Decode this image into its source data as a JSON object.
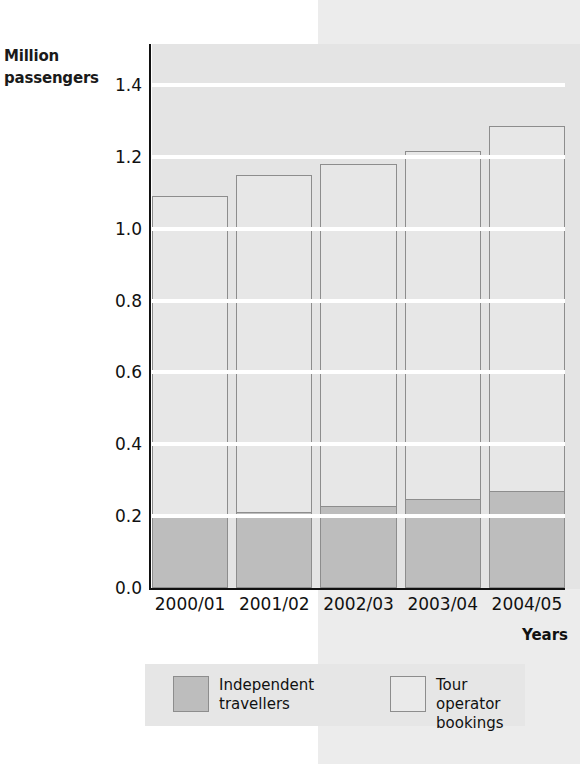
{
  "chart_data": {
    "type": "bar",
    "stacked": true,
    "title": "",
    "subtitle": "",
    "xlabel": "Years",
    "ylabel": "Million passengers",
    "categories": [
      "2000/01",
      "2001/02",
      "2002/03",
      "2003/04",
      "2004/05"
    ],
    "series": [
      {
        "name": "Independent travellers",
        "color": "#bdbdbd",
        "values": [
          0.2,
          0.21,
          0.225,
          0.245,
          0.268
        ]
      },
      {
        "name": "Tour operator bookings",
        "color": "#e7e7e7",
        "values": [
          0.89,
          0.94,
          0.955,
          0.97,
          1.017
        ]
      }
    ],
    "totals": [
      1.09,
      1.15,
      1.18,
      1.215,
      1.285
    ],
    "ylim": [
      0.0,
      1.4
    ],
    "ytick_step": 0.2,
    "yticks": [
      "1.4",
      "1.2",
      "1.0",
      "0.8",
      "0.6",
      "0.4",
      "0.2",
      "0.0"
    ],
    "ytick_values": [
      1.4,
      1.2,
      1.0,
      0.8,
      0.6,
      0.4,
      0.2,
      0.0
    ],
    "grid": true,
    "grid_color": "#ffffff",
    "legend_position": "bottom"
  },
  "axis": {
    "y_title_line1": "Million",
    "y_title_line2": "passengers",
    "x_title": "Years"
  },
  "legend": {
    "entries": [
      {
        "label": "Independent\ntravellers",
        "swatch": "dark"
      },
      {
        "label": "Tour operator\nbookings",
        "swatch": "light"
      }
    ]
  },
  "colors": {
    "independent_travellers": "#bdbdbd",
    "tour_operator_bookings": "#e7e7e7",
    "gridline": "#ffffff",
    "axis": "#111111",
    "panel_background": "#ececec"
  }
}
